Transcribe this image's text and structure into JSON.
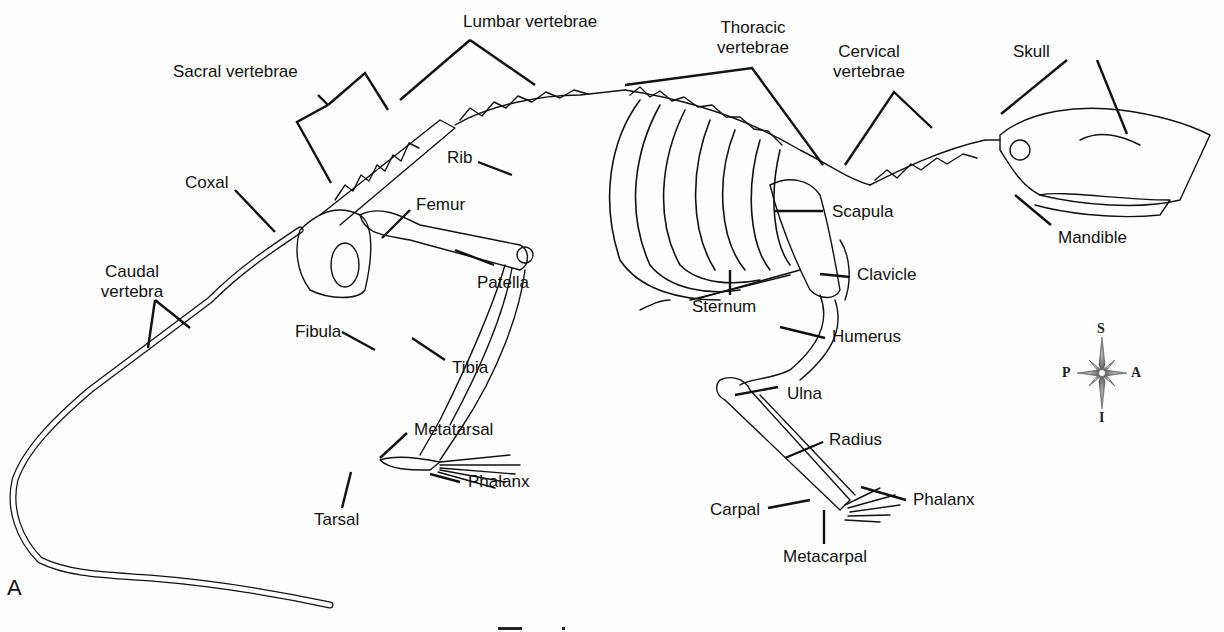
{
  "figure": {
    "panel_letter": "A",
    "caption_partial": "F... 1"
  },
  "labels": {
    "lumbar": "Lumbar vertebrae",
    "thoracic_1": "Thoracic",
    "thoracic_2": "vertebrae",
    "cervical_1": "Cervical",
    "cervical_2": "vertebrae",
    "skull": "Skull",
    "sacral": "Sacral vertebrae",
    "rib": "Rib",
    "coxal": "Coxal",
    "femur": "Femur",
    "scapula": "Scapula",
    "mandible": "Mandible",
    "caudal_1": "Caudal",
    "caudal_2": "vertebra",
    "patella": "Patella",
    "sternum": "Sternum",
    "clavicle": "Clavicle",
    "humerus": "Humerus",
    "fibula": "Fibula",
    "tibia": "Tibia",
    "ulna": "Ulna",
    "radius": "Radius",
    "metatarsal": "Metatarsal",
    "phalanx_hind": "Phalanx",
    "tarsal": "Tarsal",
    "carpal": "Carpal",
    "phalanx_fore": "Phalanx",
    "metacarpal": "Metacarpal"
  },
  "compass": {
    "icon": "compass-rose-icon",
    "top": "S",
    "bottom": "I",
    "left": "P",
    "right": "A"
  },
  "colors": {
    "line": "#111111",
    "background": "#fefefe",
    "compass": "#6a6a6a"
  }
}
